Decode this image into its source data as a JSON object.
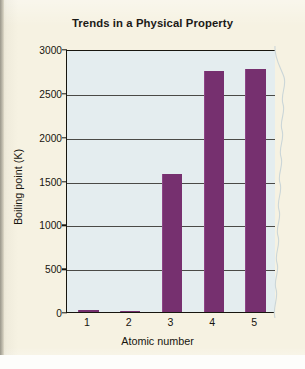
{
  "figure": {
    "kind": "scanned-textbook-figure",
    "paper_color": "#f6f2e2"
  },
  "chart_data": {
    "type": "bar",
    "title": "Trends in a Physical Property",
    "xlabel": "Atomic number",
    "ylabel": "Boiling point (K)",
    "categories": [
      "1",
      "2",
      "3",
      "4",
      "5"
    ],
    "values": [
      20,
      4,
      1570,
      2745,
      2770
    ],
    "series": [
      {
        "name": "Boiling point (K)",
        "values": [
          20,
          4,
          1570,
          2745,
          2770
        ]
      }
    ],
    "ylim": [
      0,
      3000
    ],
    "yticks": [
      0,
      500,
      1000,
      1500,
      2000,
      2500,
      3000
    ],
    "ytick_labels": [
      "0",
      "500",
      "1000",
      "1500",
      "2000",
      "2500",
      "3000"
    ],
    "grid": true,
    "grid_axis": "y",
    "legend": false,
    "legend_position": "none",
    "bar_color": "#76306f",
    "plot_background": "#e4edef",
    "axis_color": "#17160f"
  }
}
